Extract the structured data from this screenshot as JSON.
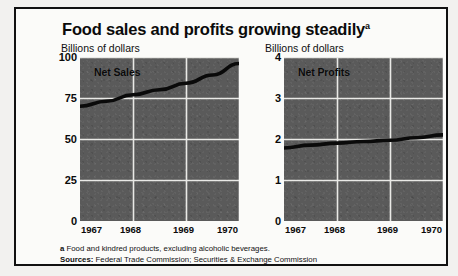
{
  "title": {
    "text": "Food sales and profits growing steadily",
    "footnote_mark": "a"
  },
  "panels": [
    {
      "id": "net-sales",
      "axis_caption": "Billions of dollars",
      "series_label": "Net Sales"
    },
    {
      "id": "net-profits",
      "axis_caption": "Billions of dollars",
      "series_label": "Net Profits"
    }
  ],
  "footnotes": {
    "mark": "a",
    "note": "Food and kindred products, excluding alcoholic beverages.",
    "sources_label": "Sources:",
    "sources": "Federal Trade Commission; Securities & Exchange Commission"
  },
  "chart_data": [
    {
      "type": "line",
      "title": "Net Sales",
      "xlabel": "",
      "ylabel": "Billions of dollars",
      "x": [
        1967,
        1968,
        1969,
        1970
      ],
      "xticks": [
        "1967",
        "1968",
        "1969",
        "1970"
      ],
      "yticks": [
        "0",
        "25",
        "50",
        "75",
        "100"
      ],
      "ylim": [
        0,
        100
      ],
      "xlim": [
        1967,
        1970
      ],
      "grid": true,
      "series": [
        {
          "name": "Net Sales",
          "values": [
            70,
            77,
            84,
            96
          ]
        }
      ],
      "points": [
        {
          "x": 1967.0,
          "y": 70
        },
        {
          "x": 1967.5,
          "y": 73
        },
        {
          "x": 1968.0,
          "y": 77
        },
        {
          "x": 1968.5,
          "y": 80
        },
        {
          "x": 1969.0,
          "y": 84
        },
        {
          "x": 1969.5,
          "y": 89
        },
        {
          "x": 1970.0,
          "y": 96
        }
      ],
      "legend_position": "inside-top-left"
    },
    {
      "type": "line",
      "title": "Net Profits",
      "xlabel": "",
      "ylabel": "Billions of dollars",
      "x": [
        1967,
        1968,
        1969,
        1970
      ],
      "xticks": [
        "1967",
        "1968",
        "1969",
        "1970"
      ],
      "yticks": [
        "0",
        "1",
        "2",
        "3",
        "4"
      ],
      "ylim": [
        0,
        4
      ],
      "xlim": [
        1967,
        1970
      ],
      "grid": true,
      "series": [
        {
          "name": "Net Profits",
          "values": [
            1.78,
            1.9,
            1.97,
            2.1
          ]
        }
      ],
      "points": [
        {
          "x": 1967.0,
          "y": 1.78
        },
        {
          "x": 1967.5,
          "y": 1.85
        },
        {
          "x": 1968.0,
          "y": 1.9
        },
        {
          "x": 1968.5,
          "y": 1.94
        },
        {
          "x": 1969.0,
          "y": 1.97
        },
        {
          "x": 1969.5,
          "y": 2.03
        },
        {
          "x": 1970.0,
          "y": 2.1
        }
      ],
      "legend_position": "inside-top-left"
    }
  ]
}
